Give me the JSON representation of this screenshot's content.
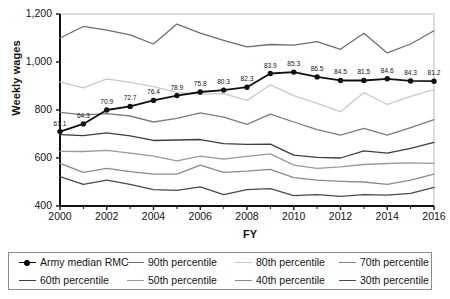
{
  "chart_data": {
    "type": "line",
    "title": "",
    "xlabel": "FY",
    "ylabel": "Weekly wages",
    "x": [
      2000,
      2001,
      2002,
      2003,
      2004,
      2005,
      2006,
      2007,
      2008,
      2009,
      2010,
      2011,
      2012,
      2013,
      2014,
      2015,
      2016
    ],
    "xtick_labels": [
      "2000",
      "2002",
      "2004",
      "2006",
      "2008",
      "2010",
      "2012",
      "2014",
      "2016"
    ],
    "ytick_labels": [
      "400",
      "600",
      "800",
      "1,000",
      "1,200"
    ],
    "ylim": [
      400,
      1200
    ],
    "xlim": [
      2000,
      2016
    ],
    "grid": false,
    "legend_position": "below-plot",
    "point_labels": [
      "61.1",
      "64.3",
      "70.9",
      "72.7",
      "76.4",
      "78.9",
      "75.8",
      "80.3",
      "82.3",
      "83.9",
      "85.3",
      "86.5",
      "84.5",
      "81.5",
      "84.6",
      "84.3",
      "81.2"
    ],
    "series": [
      {
        "name": "Army median RMC",
        "color": "#111111",
        "markers": true,
        "labeled": true,
        "values": [
          710,
          742,
          800,
          815,
          840,
          860,
          875,
          883,
          895,
          952,
          958,
          938,
          923,
          923,
          930,
          921,
          920
        ]
      },
      {
        "name": "90th percentile",
        "color": "#6e6e6e",
        "markers": false,
        "labeled": false,
        "values": [
          1100,
          1148,
          1133,
          1113,
          1075,
          1158,
          1120,
          1090,
          1063,
          1073,
          1070,
          1085,
          1053,
          1120,
          1038,
          1075,
          1130
        ]
      },
      {
        "name": "80th percentile",
        "color": "#c9c9c9",
        "markers": false,
        "labeled": false,
        "values": [
          917,
          892,
          930,
          915,
          897,
          873,
          865,
          868,
          840,
          905,
          860,
          828,
          793,
          873,
          823,
          857,
          885
        ]
      },
      {
        "name": "70th percentile",
        "color": "#7d7d7d",
        "markers": false,
        "labeled": false,
        "values": [
          790,
          780,
          785,
          775,
          750,
          765,
          788,
          770,
          740,
          783,
          750,
          718,
          695,
          723,
          695,
          727,
          760
        ]
      },
      {
        "name": "60th percentile",
        "color": "#3d3d3d",
        "markers": false,
        "labeled": false,
        "values": [
          697,
          693,
          705,
          692,
          673,
          675,
          677,
          660,
          657,
          658,
          612,
          603,
          600,
          630,
          620,
          640,
          665
        ]
      },
      {
        "name": "50th percentile",
        "color": "#9a9a9a",
        "markers": false,
        "labeled": false,
        "values": [
          628,
          627,
          632,
          620,
          608,
          588,
          608,
          595,
          607,
          617,
          570,
          557,
          563,
          573,
          577,
          580,
          578
        ]
      },
      {
        "name": "40th percentile",
        "color": "#8a8a8a",
        "markers": false,
        "labeled": false,
        "values": [
          578,
          540,
          557,
          543,
          533,
          533,
          570,
          540,
          545,
          553,
          518,
          508,
          503,
          500,
          490,
          508,
          533
        ]
      },
      {
        "name": "30th percentile",
        "color": "#4a4a4a",
        "markers": false,
        "labeled": false,
        "values": [
          522,
          490,
          508,
          490,
          468,
          465,
          480,
          447,
          468,
          472,
          443,
          447,
          440,
          447,
          445,
          453,
          478
        ]
      }
    ]
  },
  "legend": {
    "entries": [
      {
        "label": "Army median RMC",
        "color": "#111111",
        "marker": true
      },
      {
        "label": "90th percentile",
        "color": "#6e6e6e",
        "marker": false
      },
      {
        "label": "80th percentile",
        "color": "#c9c9c9",
        "marker": false
      },
      {
        "label": "70th percentile",
        "color": "#7d7d7d",
        "marker": false
      },
      {
        "label": "60th percentile",
        "color": "#3d3d3d",
        "marker": false
      },
      {
        "label": "50th percentile",
        "color": "#9a9a9a",
        "marker": false
      },
      {
        "label": "40th percentile",
        "color": "#8a8a8a",
        "marker": false
      },
      {
        "label": "30th percentile",
        "color": "#4a4a4a",
        "marker": false
      }
    ]
  }
}
